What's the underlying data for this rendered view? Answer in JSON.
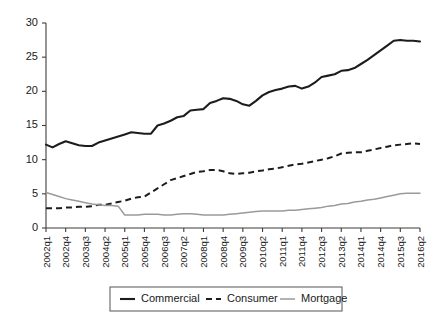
{
  "chart_data": {
    "type": "line",
    "title": "",
    "subtitle": "",
    "xlabel": "",
    "ylabel": "",
    "ylim": [
      0,
      30
    ],
    "yticks": [
      0,
      5,
      10,
      15,
      20,
      25,
      30
    ],
    "grid": false,
    "legend_position": "bottom",
    "x": [
      "2002q1",
      "2002q2",
      "2002q3",
      "2002q4",
      "2003q1",
      "2003q2",
      "2003q3",
      "2003q4",
      "2004q1",
      "2004q2",
      "2004q3",
      "2004q4",
      "2005q1",
      "2005q2",
      "2005q3",
      "2005q4",
      "2006q1",
      "2006q2",
      "2006q3",
      "2006q4",
      "2007q1",
      "2007q2",
      "2007q3",
      "2007q4",
      "2008q1",
      "2008q2",
      "2008q3",
      "2008q4",
      "2009q1",
      "2009q2",
      "2009q3",
      "2009q4",
      "2010q1",
      "2010q2",
      "2010q3",
      "2010q4",
      "2011q1",
      "2011q2",
      "2011q3",
      "2011q4",
      "2012q1",
      "2012q2",
      "2012q3",
      "2012q4",
      "2013q1",
      "2013q2",
      "2013q3",
      "2013q4",
      "2014q1",
      "2014q2",
      "2014q3",
      "2014q4",
      "2015q1",
      "2015q2",
      "2015q3",
      "2015q4",
      "2016q1",
      "2016q2"
    ],
    "xtick_labels": [
      "2002q1",
      "2002q4",
      "2003q3",
      "2004q2",
      "2005q1",
      "2005q4",
      "2006q3",
      "2007q2",
      "2008q1",
      "2008q4",
      "2009q3",
      "2010q2",
      "2011q1",
      "2011q4",
      "2012q3",
      "2013q2",
      "2014q1",
      "2014q4",
      "2015q3",
      "2016q2"
    ],
    "xtick_indices": [
      0,
      3,
      6,
      9,
      12,
      15,
      18,
      21,
      24,
      27,
      30,
      33,
      36,
      39,
      42,
      45,
      48,
      51,
      54,
      57
    ],
    "series": [
      {
        "name": "Commercial",
        "style": "solid",
        "color": "#1c1c1c",
        "values": [
          12.2,
          11.8,
          12.3,
          12.7,
          12.4,
          12.1,
          12.0,
          12.0,
          12.5,
          12.8,
          13.1,
          13.4,
          13.7,
          14.0,
          13.9,
          13.8,
          13.8,
          15.0,
          15.3,
          15.7,
          16.2,
          16.4,
          17.2,
          17.3,
          17.4,
          18.3,
          18.6,
          19.0,
          18.9,
          18.6,
          18.1,
          17.9,
          18.6,
          19.4,
          19.9,
          20.2,
          20.4,
          20.7,
          20.8,
          20.4,
          20.7,
          21.3,
          22.1,
          22.3,
          22.5,
          23.0,
          23.1,
          23.4,
          24.0,
          24.6,
          25.3,
          26.0,
          26.7,
          27.4,
          27.5,
          27.4,
          27.4,
          27.3
        ]
      },
      {
        "name": "Consumer",
        "style": "dashed",
        "color": "#1c1c1c",
        "values": [
          2.9,
          2.9,
          2.9,
          3.0,
          3.0,
          3.1,
          3.1,
          3.2,
          3.4,
          3.4,
          3.6,
          3.8,
          4.0,
          4.3,
          4.5,
          4.6,
          5.2,
          5.8,
          6.4,
          7.0,
          7.3,
          7.6,
          7.9,
          8.2,
          8.3,
          8.5,
          8.5,
          8.3,
          8.0,
          7.9,
          8.0,
          8.1,
          8.3,
          8.4,
          8.6,
          8.7,
          8.9,
          9.1,
          9.3,
          9.4,
          9.6,
          9.8,
          10.0,
          10.2,
          10.5,
          10.9,
          11.0,
          11.1,
          11.1,
          11.3,
          11.5,
          11.7,
          11.9,
          12.1,
          12.2,
          12.3,
          12.4,
          12.3
        ]
      },
      {
        "name": "Mortgage",
        "style": "solid",
        "color": "#9a9a9a",
        "values": [
          5.2,
          4.9,
          4.6,
          4.3,
          4.1,
          3.9,
          3.7,
          3.5,
          3.4,
          3.3,
          3.3,
          3.2,
          1.9,
          1.9,
          1.9,
          2.0,
          2.0,
          2.0,
          1.9,
          1.9,
          2.0,
          2.1,
          2.1,
          2.0,
          1.9,
          1.9,
          1.9,
          1.9,
          2.0,
          2.1,
          2.2,
          2.3,
          2.4,
          2.5,
          2.5,
          2.5,
          2.5,
          2.6,
          2.6,
          2.7,
          2.8,
          2.9,
          3.0,
          3.2,
          3.3,
          3.5,
          3.6,
          3.8,
          3.9,
          4.1,
          4.2,
          4.4,
          4.6,
          4.8,
          5.0,
          5.1,
          5.1,
          5.1
        ]
      }
    ],
    "legend": [
      {
        "label": "Commercial",
        "style": "solid",
        "color": "#1c1c1c"
      },
      {
        "label": "Consumer",
        "style": "dashed",
        "color": "#1c1c1c"
      },
      {
        "label": "Mortgage",
        "style": "solid",
        "color": "#9a9a9a"
      }
    ]
  }
}
